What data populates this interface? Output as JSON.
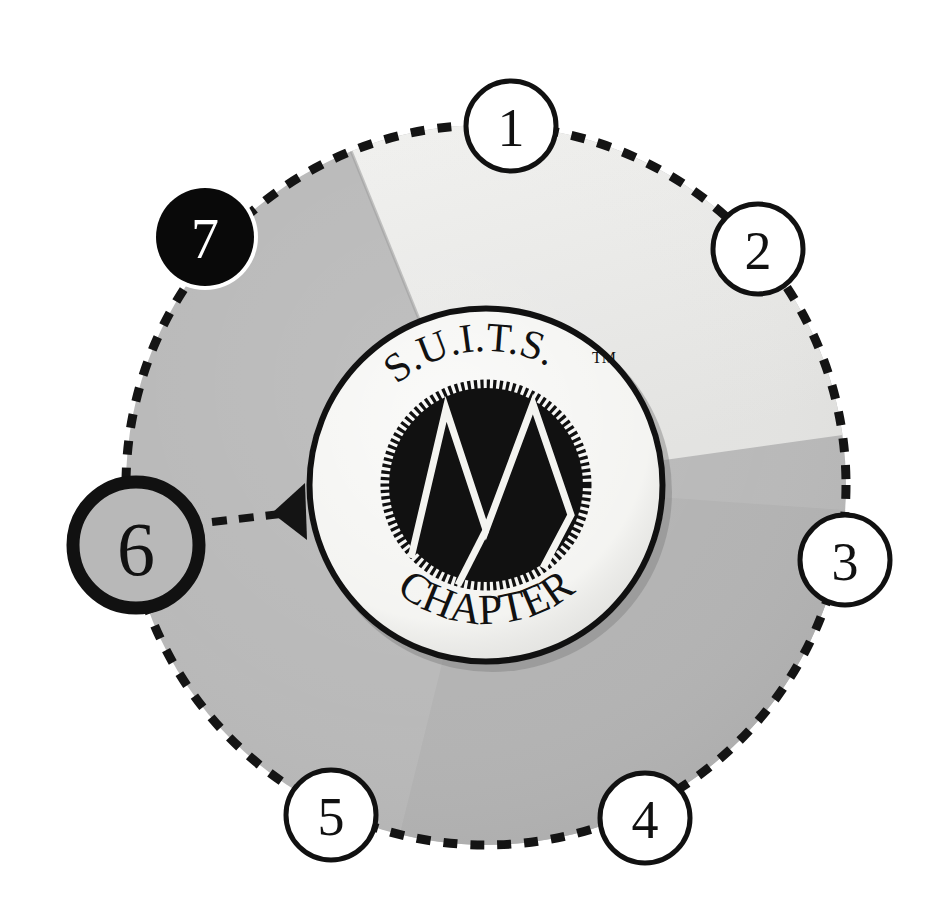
{
  "diagram": {
    "type": "radial-numbered-wheel",
    "canvas": {
      "width": 931,
      "height": 903
    },
    "background_color": "#ffffff"
  },
  "emblem": {
    "top_text": "S.U.I.T.S.",
    "trademark_mark": "TM",
    "bottom_text": "CHAPTER",
    "monogram": "W",
    "face_color": "#f2f2ef",
    "ring_color": "#111111",
    "hub_color": "#111111",
    "monogram_color": "#f4f4f0",
    "center_x": 486,
    "center_y": 485,
    "outer_radius": 179,
    "hub_radius": 103
  },
  "wheel": {
    "center_x": 486,
    "center_y": 485,
    "radius": 360,
    "dash_color": "#141414",
    "dash_pattern": "14 13",
    "dash_width": 9,
    "sectors": [
      {
        "name": "sector-light",
        "start_deg": -68,
        "end_deg": 8,
        "color": "#ececea",
        "label": "light segment"
      },
      {
        "name": "sector-mid",
        "start_deg": 8,
        "end_deg": 104,
        "color": "#b2b2b2",
        "label": "mid gray segment"
      },
      {
        "name": "sector-main",
        "start_deg": 104,
        "end_deg": 292,
        "color": "#b8b8b8",
        "label": "main gray segment"
      }
    ]
  },
  "nodes": [
    {
      "id": "node-1",
      "label": "1",
      "angle_deg": -86,
      "radius": 45,
      "style": "outline",
      "fill": "#ffffff",
      "stroke": "#111111",
      "stroke_width": 5,
      "text_color": "#111111",
      "font_size": 54
    },
    {
      "id": "node-2",
      "label": "2",
      "angle_deg": -41,
      "radius": 45,
      "style": "outline",
      "fill": "#ffffff",
      "stroke": "#111111",
      "stroke_width": 5,
      "text_color": "#111111",
      "font_size": 54
    },
    {
      "id": "node-3",
      "label": "3",
      "angle_deg": 4,
      "radius": 45,
      "style": "outline",
      "fill": "#ffffff",
      "stroke": "#111111",
      "stroke_width": 5,
      "text_color": "#111111",
      "font_size": 54
    },
    {
      "id": "node-4",
      "label": "4",
      "angle_deg": 58,
      "radius": 45,
      "style": "outline",
      "fill": "#ffffff",
      "stroke": "#111111",
      "stroke_width": 5,
      "text_color": "#111111",
      "font_size": 54
    },
    {
      "id": "node-5",
      "label": "5",
      "angle_deg": 104,
      "radius": 45,
      "style": "outline",
      "fill": "#ffffff",
      "stroke": "#111111",
      "stroke_width": 5,
      "text_color": "#111111",
      "font_size": 54
    },
    {
      "id": "node-6",
      "label": "6",
      "angle_deg": 172,
      "radius": 63,
      "style": "emphasized",
      "fill": "#b8b8b8",
      "stroke": "#111111",
      "stroke_width": 13,
      "text_color": "#111111",
      "font_size": 76
    },
    {
      "id": "node-7",
      "label": "7",
      "angle_deg": -141,
      "radius": 50,
      "style": "filled",
      "fill": "#090909",
      "stroke": "#ffffff",
      "stroke_width": 4,
      "text_color": "#ffffff",
      "font_size": 56
    }
  ],
  "connector": {
    "name": "callout-arrow",
    "from_node": "node-6",
    "to": "emblem",
    "color": "#141414",
    "dash_pattern": "15 12",
    "line_width": 8,
    "arrow_direction": "left",
    "start_x": 212,
    "start_y": 522,
    "end_x": 300,
    "end_y": 512
  }
}
